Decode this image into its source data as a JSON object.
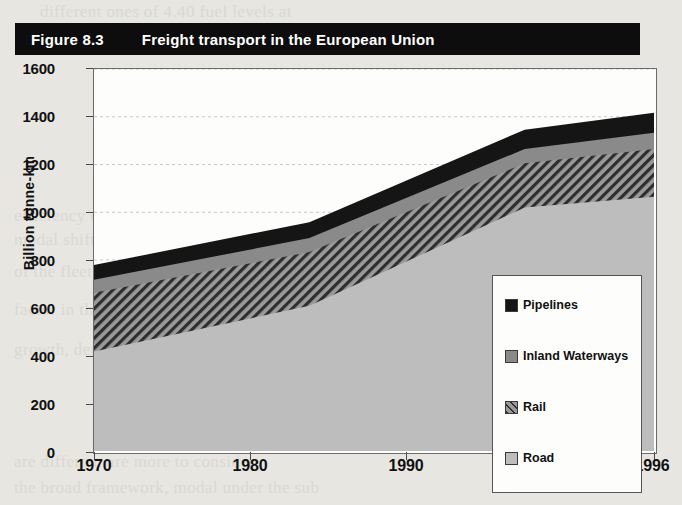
{
  "figure": {
    "number": "Figure 8.3",
    "title": "Freight transport in the European Union"
  },
  "chart_data": {
    "type": "area",
    "title": "Freight transport in the European Union",
    "subtitle": "",
    "xlabel": "",
    "ylabel": "Billion tonne-km",
    "xlim": [
      1970,
      1996
    ],
    "ylim": [
      0,
      1600
    ],
    "yticks": [
      0,
      200,
      400,
      600,
      800,
      1000,
      1200,
      1400,
      1600
    ],
    "xticks": [
      1970,
      1980,
      1990,
      1996
    ],
    "xtick_labels": [
      "1970",
      "1980",
      "1990",
      "1996"
    ],
    "grid": true,
    "stacked": true,
    "legend_position": "inside-right",
    "x": [
      1970,
      1980,
      1990,
      1996
    ],
    "series": [
      {
        "name": "Road",
        "values": [
          417,
          608,
          1020,
          1065
        ]
      },
      {
        "name": "Rail",
        "values": [
          246,
          225,
          185,
          200
        ]
      },
      {
        "name": "Inland Waterways",
        "values": [
          54,
          59,
          60,
          68
        ]
      },
      {
        "name": "Pipelines",
        "values": [
          62,
          66,
          81,
          84
        ]
      }
    ],
    "cumulative_tops": {
      "Road": [
        417,
        608,
        1020,
        1065
      ],
      "Rail": [
        663,
        833,
        1205,
        1265
      ],
      "Inland Waterways": [
        717,
        892,
        1265,
        1333
      ],
      "Pipelines": [
        779,
        958,
        1346,
        1417
      ]
    },
    "colors": {
      "Road": "#b6b6b6",
      "Rail": "#8f8f8f",
      "Inland Waterways": "#8a8a8a",
      "Pipelines": "#151515",
      "plot_background": "#fdfdfb",
      "axis": "#4a4a4a",
      "banner": "#0d0d0d"
    },
    "patterns": {
      "Road": "solid-light-gray",
      "Rail": "diagonal-hatch",
      "Inland Waterways": "solid-mid-gray",
      "Pipelines": "solid-black"
    }
  },
  "yaxis": {
    "label": "Billion tonne-km",
    "ticks": [
      "1600",
      "1400",
      "1200",
      "1000",
      "800",
      "600",
      "400",
      "200",
      "0"
    ]
  },
  "xaxis": {
    "ticks": [
      "1970",
      "1980",
      "1990",
      "1996"
    ]
  },
  "legend": {
    "items": [
      {
        "label": "Pipelines",
        "swatch": "swatch-pipelines"
      },
      {
        "label": "Inland Waterways",
        "swatch": "swatch-inland-waterways"
      },
      {
        "label": "Rail",
        "swatch": "swatch-rail"
      },
      {
        "label": "Road",
        "swatch": "swatch-road"
      }
    ]
  },
  "page_bleed": {
    "lines": [
      "different ones of 4.40 fuel levels at",
      "also among the freight transport",
      "nation has been developed with a",
      "for energy in a much greater",
      "oil consumption the 1970s. Cri",
      "efficiency of these",
      "modal shift",
      "of the fleet is CO2 emission",
      "factor in the transport",
      "growth, demand and",
      "are different are more to consider",
      "the broad framework, modal under the sub"
    ]
  }
}
